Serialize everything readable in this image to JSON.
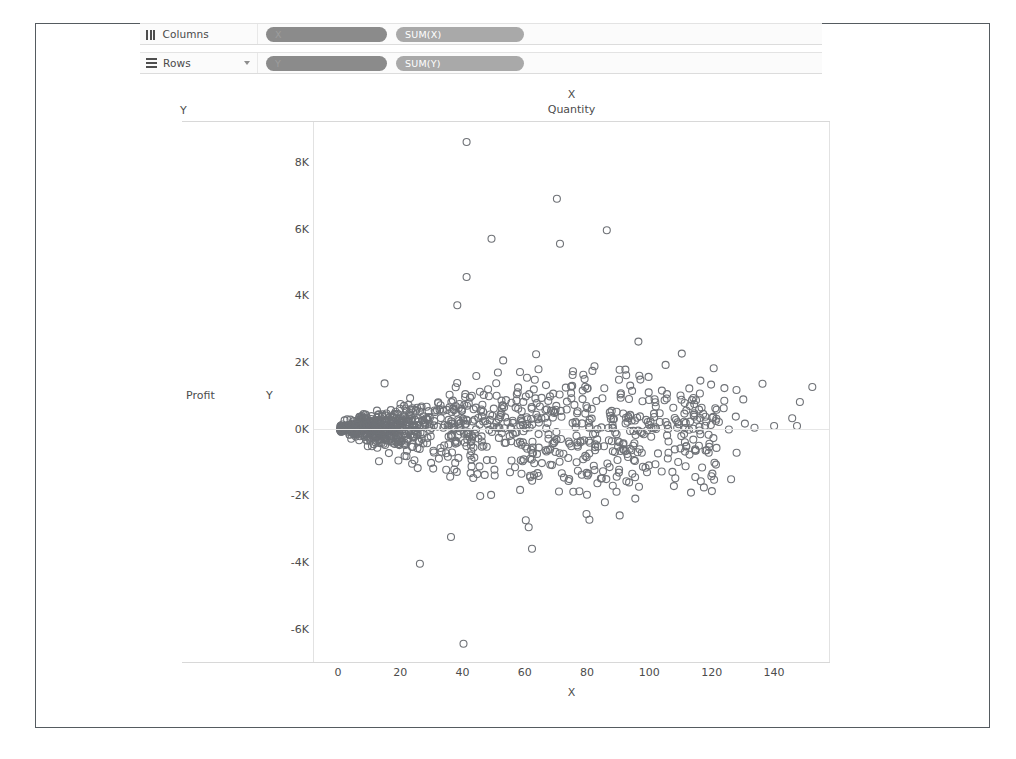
{
  "shelves": {
    "columns": {
      "label": "Columns",
      "icon": "columns-icon",
      "pills": [
        {
          "text": "X",
          "kind": "dimension"
        },
        {
          "text": "SUM(X)",
          "kind": "measure"
        }
      ]
    },
    "rows": {
      "label": "Rows",
      "icon": "rows-icon",
      "caret": "chevron-down-icon",
      "pills": [
        {
          "text": "Y",
          "kind": "dimension"
        },
        {
          "text": "SUM(Y)",
          "kind": "measure"
        }
      ]
    }
  },
  "headers": {
    "column_field": "Y",
    "column_title_line1": "X",
    "column_title_line2": "Quantity",
    "row_field": "Profit",
    "row_axis_letter": "Y"
  },
  "colors": {
    "mark": "#6f7277",
    "pill_dimension": "#8b8b8b",
    "pill_measure": "#a9a9a9",
    "axis_text": "#4c4c4c",
    "gridline": "#e2e2e2",
    "frame": "#555b60"
  },
  "chart_data": {
    "type": "scatter",
    "title": "Quantity",
    "xlabel": "X",
    "ylabel": "Profit",
    "x_field": "SUM(X)",
    "y_field": "SUM(Y)",
    "grid": false,
    "legend": "none",
    "xlim": [
      -8,
      158
    ],
    "ylim": [
      -7000,
      9200
    ],
    "xticks": [
      0,
      20,
      40,
      60,
      80,
      100,
      120,
      140
    ],
    "yticks": [
      -6000,
      -4000,
      -2000,
      0,
      2000,
      4000,
      6000,
      8000
    ],
    "ytick_labels": [
      "-6K",
      "-4K",
      "-2K",
      "0K",
      "2K",
      "4K",
      "6K",
      "8K"
    ],
    "xtick_labels": [
      "0",
      "20",
      "40",
      "60",
      "80",
      "100",
      "120",
      "140"
    ],
    "marker": {
      "shape": "circle-open",
      "size": 7,
      "stroke": "#6f7277",
      "stroke_width": 1.1,
      "fill": "none"
    },
    "zero_reference_line": 0,
    "n_points": 900,
    "distribution": {
      "note": "Heteroscedastic funnel: profit spread widens with quantity; dense cluster near origin.",
      "x_mode": "gamma-like, mass 0-90, tail to 152",
      "y_spread_at_x": [
        [
          0,
          60
        ],
        [
          20,
          380
        ],
        [
          40,
          700
        ],
        [
          60,
          900
        ],
        [
          80,
          1000
        ],
        [
          100,
          900
        ],
        [
          120,
          700
        ],
        [
          150,
          500
        ]
      ]
    },
    "notable_points": [
      {
        "x": 41,
        "y": 8600,
        "note": "top outlier"
      },
      {
        "x": 70,
        "y": 6900
      },
      {
        "x": 86,
        "y": 5950
      },
      {
        "x": 49,
        "y": 5700
      },
      {
        "x": 71,
        "y": 5550
      },
      {
        "x": 41,
        "y": 4550
      },
      {
        "x": 38,
        "y": 3700
      },
      {
        "x": 26,
        "y": -4050
      },
      {
        "x": 36,
        "y": -3250
      },
      {
        "x": 62,
        "y": -3600
      },
      {
        "x": 60,
        "y": -2750
      },
      {
        "x": 40,
        "y": -6450,
        "note": "bottom outlier"
      },
      {
        "x": 152,
        "y": 1250
      },
      {
        "x": 148,
        "y": 800
      },
      {
        "x": 136,
        "y": 1350
      },
      {
        "x": 122,
        "y": 200
      },
      {
        "x": 121,
        "y": 230
      }
    ]
  }
}
